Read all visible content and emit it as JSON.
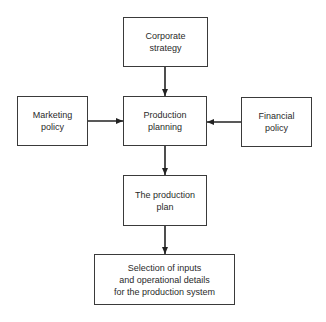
{
  "diagram": {
    "nodes": {
      "corporate_strategy": "Corporate\nstrategy",
      "marketing_policy": "Marketing\npolicy",
      "production_planning": "Production\nplanning",
      "financial_policy": "Financial\npolicy",
      "production_plan": "The production\nplan",
      "selection": "Selection of inputs\nand operational details\nfor the production system"
    },
    "edges": [
      {
        "from": "corporate_strategy",
        "to": "production_planning"
      },
      {
        "from": "marketing_policy",
        "to": "production_planning"
      },
      {
        "from": "financial_policy",
        "to": "production_planning"
      },
      {
        "from": "production_planning",
        "to": "production_plan"
      },
      {
        "from": "production_plan",
        "to": "selection"
      }
    ]
  }
}
